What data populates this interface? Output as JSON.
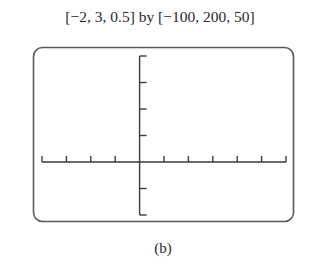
{
  "chart_data": {
    "type": "line",
    "title": "[−2, 3, 0.5] by [−100, 200, 50]",
    "xlabel": "",
    "ylabel": "",
    "xlim": [
      -2,
      3
    ],
    "ylim": [
      -100,
      200
    ],
    "xscl": 0.5,
    "yscl": 50,
    "x_ticks": [
      -2,
      -1.5,
      -1,
      -0.5,
      0,
      0.5,
      1,
      1.5,
      2,
      2.5,
      3
    ],
    "y_ticks": [
      -100,
      -50,
      0,
      50,
      100,
      150,
      200
    ],
    "series": [],
    "grid": false,
    "legend": null,
    "caption": "(b)"
  },
  "window": {
    "label": "[−2, 3, 0.5] by [−100, 200, 50]"
  },
  "caption": "(b)",
  "colors": {
    "frame": "#555555",
    "axis": "#3a3a3a",
    "background": "#ffffff"
  }
}
